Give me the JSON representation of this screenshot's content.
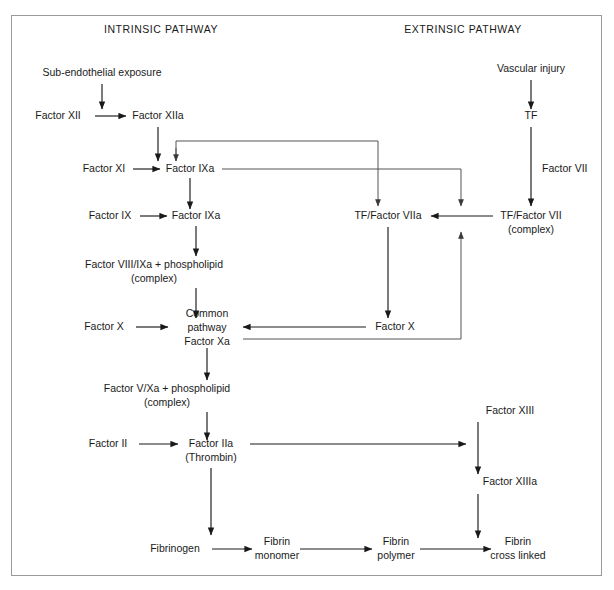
{
  "diagram": {
    "frame": {
      "x": 11,
      "y": 15,
      "width": 591,
      "height": 561,
      "stroke": "#9a9a9a"
    },
    "colors": {
      "ink": "#1a1a1a",
      "line": "#1a1a1a",
      "thin_line": "#4a4a4a",
      "frame": "#9a9a9a",
      "background": "#ffffff"
    },
    "headings": [
      {
        "id": "intrinsic",
        "label": "INTRINSIC PATHWAY",
        "x": 161,
        "y": 33
      },
      {
        "id": "extrinsic",
        "label": "EXTRINSIC PATHWAY",
        "x": 463,
        "y": 33
      }
    ],
    "nodes": [
      {
        "id": "sub-endothelial-exposure",
        "lines": [
          "Sub-endothelial exposure"
        ],
        "x": 102,
        "y": 76
      },
      {
        "id": "factor-xii",
        "lines": [
          "Factor XII"
        ],
        "x": 58,
        "y": 119
      },
      {
        "id": "factor-xiia",
        "lines": [
          "Factor XIIa"
        ],
        "x": 158,
        "y": 119
      },
      {
        "id": "factor-xi",
        "lines": [
          "Factor XI"
        ],
        "x": 104,
        "y": 172
      },
      {
        "id": "factor-ixa-top",
        "lines": [
          "Factor IXa"
        ],
        "x": 190,
        "y": 172
      },
      {
        "id": "factor-ix",
        "lines": [
          "Factor IX"
        ],
        "x": 110,
        "y": 219
      },
      {
        "id": "factor-ixa-mid",
        "lines": [
          "Factor IXa"
        ],
        "x": 196,
        "y": 219
      },
      {
        "id": "factor-viii-ixa-complex",
        "lines": [
          "Factor VIII/IXa + phospholipid",
          "(complex)"
        ],
        "x": 154,
        "y": 268
      },
      {
        "id": "factor-x-left",
        "lines": [
          "Factor X"
        ],
        "x": 104,
        "y": 330
      },
      {
        "id": "common-pathway",
        "lines": [
          "Common",
          "pathway",
          "Factor Xa"
        ],
        "x": 207,
        "y": 317
      },
      {
        "id": "factor-v-xa-complex",
        "lines": [
          "Factor V/Xa + phospholipid",
          "(complex)"
        ],
        "x": 167,
        "y": 392
      },
      {
        "id": "factor-ii",
        "lines": [
          "Factor II"
        ],
        "x": 108,
        "y": 447
      },
      {
        "id": "factor-iia",
        "lines": [
          "Factor IIa",
          "(Thrombin)"
        ],
        "x": 211,
        "y": 447
      },
      {
        "id": "fibrinogen",
        "lines": [
          "Fibrinogen"
        ],
        "x": 175,
        "y": 552
      },
      {
        "id": "fibrin-monomer",
        "lines": [
          "Fibrin",
          "monomer"
        ],
        "x": 277,
        "y": 545
      },
      {
        "id": "fibrin-polymer",
        "lines": [
          "Fibrin",
          "polymer"
        ],
        "x": 396,
        "y": 545
      },
      {
        "id": "fibrin-cross-linked",
        "lines": [
          "Fibrin",
          "cross linked"
        ],
        "x": 518,
        "y": 545
      },
      {
        "id": "vascular-injury",
        "lines": [
          "Vascular injury"
        ],
        "x": 531,
        "y": 72
      },
      {
        "id": "tf",
        "lines": [
          "TF"
        ],
        "x": 531,
        "y": 119
      },
      {
        "id": "factor-vii",
        "lines": [
          "Factor VII"
        ],
        "x": 553,
        "y": 172,
        "anchor": "start"
      },
      {
        "id": "tf-factor-vii-complex",
        "lines": [
          "TF/Factor VII",
          "(complex)"
        ],
        "x": 531,
        "y": 219
      },
      {
        "id": "tf-factor-viia",
        "lines": [
          "TF/Factor VIIa"
        ],
        "x": 388,
        "y": 219
      },
      {
        "id": "factor-x-right",
        "lines": [
          "Factor X"
        ],
        "x": 395,
        "y": 330
      },
      {
        "id": "factor-xiii",
        "lines": [
          "Factor XIII"
        ],
        "x": 478,
        "y": 414
      },
      {
        "id": "factor-xiiia",
        "lines": [
          "Factor XIIIa"
        ],
        "x": 478,
        "y": 485
      }
    ],
    "edges": [
      {
        "id": "exposure-to-xii",
        "from": "sub-endothelial-exposure",
        "to": "factor-xii",
        "kind": "arrow-down"
      },
      {
        "id": "xii-to-xiia",
        "from": "factor-xii",
        "to": "factor-xiia",
        "kind": "arrow-right"
      },
      {
        "id": "xiia-to-xi",
        "from": "factor-xiia",
        "to": "factor-xi",
        "kind": "arrow-down"
      },
      {
        "id": "xi-to-ixa",
        "from": "factor-xi",
        "to": "factor-ixa-top",
        "kind": "arrow-right"
      },
      {
        "id": "ixa-to-ix",
        "from": "factor-ixa-top",
        "to": "factor-ix",
        "kind": "arrow-down"
      },
      {
        "id": "ix-to-ixa",
        "from": "factor-ix",
        "to": "factor-ixa-mid",
        "kind": "arrow-right"
      },
      {
        "id": "ixa-to-viii-complex",
        "from": "factor-ixa-mid",
        "to": "factor-viii-ixa-complex",
        "kind": "arrow-down"
      },
      {
        "id": "viii-complex-to-common",
        "from": "factor-viii-ixa-complex",
        "to": "common-pathway",
        "kind": "arrow-down"
      },
      {
        "id": "x-to-common",
        "from": "factor-x-left",
        "to": "common-pathway",
        "kind": "arrow-right"
      },
      {
        "id": "common-to-v-complex",
        "from": "common-pathway",
        "to": "factor-v-xa-complex",
        "kind": "arrow-down"
      },
      {
        "id": "v-complex-to-ii",
        "from": "factor-v-xa-complex",
        "to": "factor-ii",
        "kind": "arrow-down"
      },
      {
        "id": "ii-to-iia",
        "from": "factor-ii",
        "to": "factor-iia",
        "kind": "arrow-right"
      },
      {
        "id": "iia-to-fibrinogen",
        "from": "factor-iia",
        "to": "fibrinogen",
        "kind": "arrow-down"
      },
      {
        "id": "iia-to-xiii",
        "from": "factor-iia",
        "to": "factor-xiii",
        "kind": "arrow-right"
      },
      {
        "id": "fibrinogen-to-monomer",
        "from": "fibrinogen",
        "to": "fibrin-monomer",
        "kind": "arrow-right"
      },
      {
        "id": "monomer-to-polymer",
        "from": "fibrin-monomer",
        "to": "fibrin-polymer",
        "kind": "arrow-right"
      },
      {
        "id": "polymer-to-cross-linked",
        "from": "fibrin-polymer",
        "to": "fibrin-cross-linked",
        "kind": "arrow-right"
      },
      {
        "id": "xiii-to-xiiia",
        "from": "factor-xiii",
        "to": "factor-xiiia",
        "kind": "arrow-down"
      },
      {
        "id": "xiiia-to-polymer-step",
        "from": "factor-xiiia",
        "to": "polymer-to-cross-linked",
        "kind": "arrow-down"
      },
      {
        "id": "vascular-injury-to-tf",
        "from": "vascular-injury",
        "to": "tf",
        "kind": "arrow-down"
      },
      {
        "id": "tf-to-complex",
        "from": "tf",
        "to": "tf-factor-vii-complex",
        "kind": "arrow-down",
        "label": "Factor VII"
      },
      {
        "id": "complex-to-viia",
        "from": "tf-factor-vii-complex",
        "to": "tf-factor-viia",
        "kind": "arrow-left"
      },
      {
        "id": "viia-to-factor-x-right",
        "from": "tf-factor-viia",
        "to": "factor-x-right",
        "kind": "arrow-down"
      },
      {
        "id": "factor-x-right-to-common",
        "from": "factor-x-right",
        "to": "common-pathway",
        "kind": "arrow-left"
      },
      {
        "id": "xiia-feedback-to-ixa",
        "from": "tf-factor-viia",
        "to": "factor-ixa-top",
        "kind": "feedback-loop"
      },
      {
        "id": "ixa-activates-complex",
        "from": "factor-ixa-top",
        "to": "tf-factor-vii-complex",
        "kind": "feedback-loop"
      },
      {
        "id": "xa-activates-vii-complex",
        "from": "common-pathway",
        "to": "tf-factor-vii-complex",
        "kind": "feedback-loop"
      }
    ]
  }
}
